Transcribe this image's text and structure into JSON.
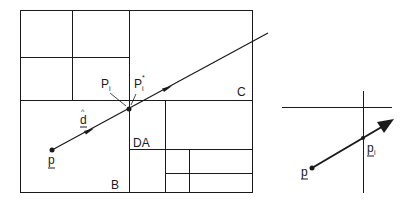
{
  "figure": {
    "left_panel": {
      "labels": {
        "P_i": "P",
        "P_i_sub": "i",
        "P_i_star": "P",
        "P_i_star_sub": "i",
        "P_i_star_sup": "*",
        "C": "C",
        "d_hat": "d",
        "d_hat_accent": "^",
        "p": "p",
        "DA": "DA",
        "B": "B"
      }
    },
    "right_panel": {
      "labels": {
        "p": "p",
        "p_i": "p",
        "p_i_sub": "i"
      }
    },
    "colors": {
      "stroke": "#1a1a1a",
      "background": "#ffffff"
    }
  }
}
